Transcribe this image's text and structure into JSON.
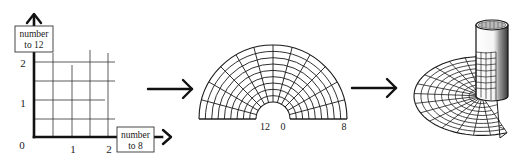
{
  "colors": {
    "ink": "#1a1a1a",
    "background": "#ffffff"
  },
  "panel1": {
    "name": "grid",
    "y_axis_label_line1": "number",
    "y_axis_label_line2": "to 12",
    "x_axis_label_line1": "number",
    "x_axis_label_line2": "to 8",
    "origin_label": "0",
    "x_ticks": [
      "1",
      "2"
    ],
    "y_ticks": [
      "1",
      "2"
    ]
  },
  "panel2": {
    "name": "semicircular-annulus",
    "labels": {
      "inner_left": "12",
      "inner_right": "0",
      "outer_right": "8"
    }
  },
  "panel3": {
    "name": "cylinder-with-fan"
  },
  "arrows": [
    {
      "name": "arrow-grid-to-annulus"
    },
    {
      "name": "arrow-annulus-to-cylinder"
    }
  ]
}
